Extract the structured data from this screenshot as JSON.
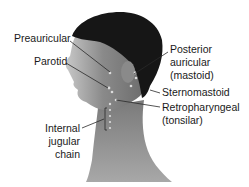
{
  "figure": {
    "colors": {
      "background": "#ffffff",
      "label_text": "#1a1a1a",
      "leader_line": "#2a2a2a",
      "skin_dark": "#5a5a5a",
      "skin_light": "#b8b8b8",
      "hair": "#151515",
      "node_dot": "#d8d8d8"
    }
  },
  "labels": {
    "preauricular": "Preauricular",
    "parotid": "Parotid",
    "posterior_auricular": {
      "line1": "Posterior",
      "line2": "auricular",
      "line3": "(mastoid)"
    },
    "sternomastoid": "Sternomastoid",
    "retropharyngeal": {
      "line1": "Retropharyngeal",
      "line2": "(tonsilar)"
    },
    "internal_jugular": {
      "line1": "Internal",
      "line2": "jugular",
      "line3": "chain"
    }
  }
}
